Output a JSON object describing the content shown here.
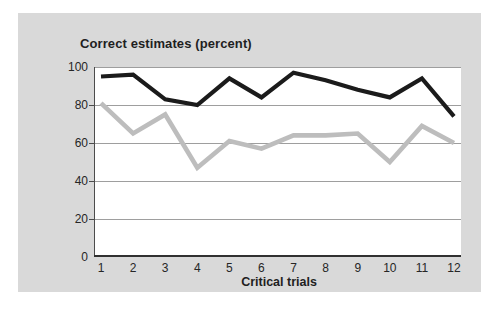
{
  "chart_data": {
    "type": "line",
    "title": "Correct estimates (percent)",
    "xlabel": "Critical trials",
    "ylabel": "",
    "categories": [
      "1",
      "2",
      "3",
      "4",
      "5",
      "6",
      "7",
      "8",
      "9",
      "10",
      "11",
      "12"
    ],
    "yticks": [
      0,
      20,
      40,
      60,
      80,
      100
    ],
    "ylim": [
      0,
      100
    ],
    "grid": "horizontal-only",
    "legend": "none",
    "series": [
      {
        "name": "black-line",
        "color": "#1b1b1b",
        "stroke_width": 4.2,
        "values": [
          95,
          96,
          83,
          80,
          94,
          84,
          97,
          93,
          88,
          84,
          94,
          74
        ]
      },
      {
        "name": "gray-line",
        "color": "#bdbdbd",
        "stroke_width": 4.6,
        "values": [
          81,
          65,
          75,
          47,
          61,
          57,
          64,
          64,
          65,
          50,
          69,
          60
        ]
      }
    ],
    "colors": {
      "panel_background": "#d9d9d9",
      "plot_background": "#ffffff",
      "gridline": "#9e9e9e",
      "axis_left": "#4c4c4c",
      "axis_bottom": "#303030",
      "text": "#1f1f1f"
    }
  }
}
